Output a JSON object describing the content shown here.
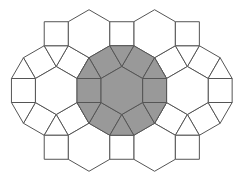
{
  "diagram": {
    "title": "",
    "type": "rhombitrihexagonal tiling patch (3.4.6.4)",
    "width": 241,
    "height": 173,
    "edge_length": 24,
    "center": [
      121.8,
      90.5
    ],
    "colors": {
      "background": "#ffffff",
      "stroke": "#555555",
      "shaded_fill": "#999999",
      "plain_fill": "#ffffff"
    },
    "hexagons": [
      {
        "id": "center",
        "lattice": [
          0,
          0
        ],
        "shaded": true,
        "ring": true
      },
      {
        "id": "left",
        "lattice": [
          -1,
          0
        ],
        "shaded": false,
        "ring": true
      },
      {
        "id": "right",
        "lattice": [
          1,
          0
        ],
        "shaded": false,
        "ring": true
      },
      {
        "id": "top-left",
        "lattice": [
          -0.5,
          -1
        ],
        "shaded": false,
        "ring": false
      },
      {
        "id": "top-right",
        "lattice": [
          0.5,
          -1
        ],
        "shaded": false,
        "ring": false
      },
      {
        "id": "bottom-left",
        "lattice": [
          -0.5,
          1
        ],
        "shaded": false,
        "ring": false
      },
      {
        "id": "bottom-right",
        "lattice": [
          0.5,
          1
        ],
        "shaded": false,
        "ring": false
      }
    ],
    "extra_squares": [
      {
        "above_ring": "left",
        "side": "top"
      },
      {
        "above_ring": "left",
        "side": "bottom"
      },
      {
        "above_ring": "center",
        "side": "top"
      },
      {
        "above_ring": "center",
        "side": "bottom"
      },
      {
        "above_ring": "right",
        "side": "top"
      },
      {
        "above_ring": "right",
        "side": "bottom"
      }
    ],
    "shaded_region": "central dodecagon: 1 hexagon + 6 squares + 6 triangles"
  }
}
